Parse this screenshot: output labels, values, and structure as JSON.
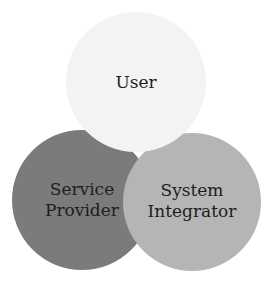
{
  "diagram": {
    "type": "three-circle overlapping diagram",
    "circles": [
      {
        "id": "user",
        "label": "User",
        "fill": "#f3f3f3"
      },
      {
        "id": "service-provider",
        "label": "Service\nProvider",
        "fill": "#7b7b7b"
      },
      {
        "id": "system-integrator",
        "label": "System\nIntegrator",
        "fill": "#b5b5b5"
      }
    ]
  }
}
